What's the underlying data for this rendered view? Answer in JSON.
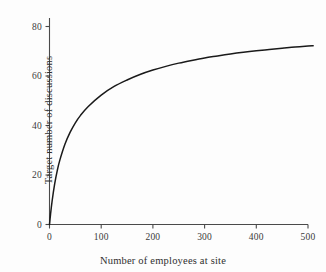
{
  "chart_data": {
    "type": "line",
    "title": "",
    "xlabel": "Number of employees at site",
    "ylabel": "Target number of discussions",
    "xlim": [
      0,
      520
    ],
    "ylim": [
      0,
      88
    ],
    "xticks": [
      0,
      100,
      200,
      300,
      400,
      500
    ],
    "xticklabels": [
      "0",
      "100",
      "200",
      "300",
      "400",
      "500"
    ],
    "yticks": [
      0,
      20,
      40,
      60,
      80
    ],
    "yticklabels": [
      "0",
      "20",
      "40",
      "60",
      "80"
    ],
    "grid": false,
    "legend": false,
    "line_color": "#1a1a1a",
    "axis_color": "#4a4a4a",
    "background_color": "#fdfdfd",
    "series": [
      {
        "name": "Target number of discussions",
        "x": [
          0,
          2,
          5,
          10,
          15,
          20,
          30,
          40,
          50,
          60,
          75,
          100,
          125,
          150,
          175,
          200,
          225,
          250,
          275,
          300,
          325,
          350,
          375,
          400,
          425,
          450,
          475,
          500,
          510
        ],
        "y": [
          0,
          4.1,
          9.4,
          16.4,
          21.8,
          26.0,
          32.5,
          37.3,
          41.1,
          44.1,
          47.7,
          52.3,
          55.8,
          58.4,
          60.6,
          62.4,
          63.9,
          65.2,
          66.3,
          67.3,
          68.1,
          68.9,
          69.6,
          70.2,
          70.7,
          71.2,
          71.7,
          72.1,
          72.2
        ],
        "note_shape": "saturating_hyperbolic"
      }
    ],
    "annotations": []
  },
  "axes": {
    "x_axis_name": "x-axis",
    "y_axis_name": "y-axis"
  }
}
